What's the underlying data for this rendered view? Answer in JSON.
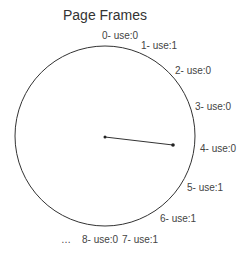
{
  "diagram": {
    "title": "Page Frames",
    "circle": {
      "cx": 105,
      "cy": 136,
      "r": 90,
      "stroke": "#333333"
    },
    "pointer": {
      "from": {
        "x": 105,
        "y": 137
      },
      "to": {
        "x": 173,
        "y": 145
      },
      "stroke": "#333333"
    },
    "frames": [
      {
        "label": "0- use:0",
        "x": 102,
        "y": 39
      },
      {
        "label": "1- use:1",
        "x": 141,
        "y": 49
      },
      {
        "label": "2- use:0",
        "x": 175,
        "y": 74
      },
      {
        "label": "3- use:0",
        "x": 195,
        "y": 110
      },
      {
        "label": "4- use:0",
        "x": 200,
        "y": 152
      },
      {
        "label": "5- use:1",
        "x": 187,
        "y": 191
      },
      {
        "label": "6- use:1",
        "x": 160,
        "y": 222
      },
      {
        "label": "7- use:1",
        "x": 122,
        "y": 243
      },
      {
        "label": "8- use:0",
        "x": 82,
        "y": 243
      }
    ],
    "ellipsis": {
      "label": "…",
      "x": 61,
      "y": 243
    }
  }
}
